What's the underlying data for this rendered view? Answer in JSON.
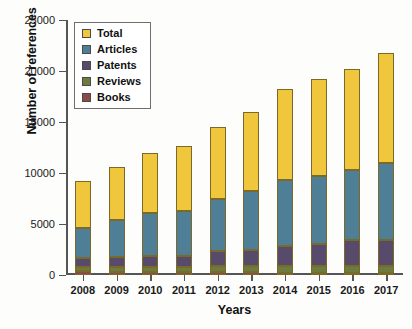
{
  "chart_data": {
    "type": "bar",
    "subtype": "stacked-bar",
    "title": "",
    "xlabel": "Years",
    "ylabel": "Number of references",
    "categories": [
      "2008",
      "2009",
      "2010",
      "2011",
      "2012",
      "2013",
      "2014",
      "2015",
      "2016",
      "2017"
    ],
    "ylim": [
      0,
      25000
    ],
    "ytick_values": [
      0,
      5000,
      10000,
      15000,
      20000,
      25000
    ],
    "ytick_labels": [
      "0",
      "5000",
      "10000",
      "15000",
      "20000",
      "25000"
    ],
    "grid": false,
    "legend_position": "top-left",
    "series": [
      {
        "name": "Books",
        "color": "#8C4A44",
        "values": [
          350,
          330,
          330,
          300,
          280,
          250,
          240,
          230,
          220,
          210
        ]
      },
      {
        "name": "Reviews",
        "color": "#6E7B3F",
        "values": [
          400,
          420,
          450,
          480,
          560,
          600,
          620,
          650,
          680,
          700
        ]
      },
      {
        "name": "Patents",
        "color": "#584A6B",
        "values": [
          950,
          1050,
          1120,
          1120,
          1560,
          1600,
          1940,
          2120,
          2550,
          2540
        ]
      },
      {
        "name": "Articles",
        "color": "#4E7F96",
        "values": [
          2900,
          3600,
          4200,
          4400,
          5100,
          5750,
          6550,
          6750,
          6850,
          7550
        ]
      },
      {
        "name": "Total",
        "color": "#F0C63C",
        "values": [
          4600,
          5200,
          5900,
          6400,
          7000,
          7800,
          8900,
          9450,
          9950,
          10800
        ]
      }
    ],
    "totals": [
      9200,
      10600,
      12000,
      12700,
      14500,
      16000,
      18250,
      19200,
      20250,
      21800
    ],
    "cumulative_tops": {
      "books": [
        350,
        330,
        330,
        300,
        280,
        250,
        240,
        230,
        220,
        210
      ],
      "reviews": [
        750,
        750,
        780,
        780,
        840,
        850,
        860,
        880,
        900,
        910
      ],
      "patents": [
        1700,
        1800,
        1900,
        1900,
        2400,
        2450,
        2800,
        3000,
        3450,
        3450
      ],
      "articles": [
        4600,
        5400,
        6100,
        6300,
        7500,
        8200,
        9350,
        9750,
        10300,
        11000
      ],
      "total": [
        9200,
        10600,
        12000,
        12700,
        14500,
        16000,
        18250,
        19200,
        20250,
        21800
      ]
    }
  },
  "legend": {
    "items": [
      {
        "label": "Total",
        "color": "#F0C63C"
      },
      {
        "label": "Articles",
        "color": "#4E7F96"
      },
      {
        "label": "Patents",
        "color": "#584A6B"
      },
      {
        "label": "Reviews",
        "color": "#6E7B3F"
      },
      {
        "label": "Books",
        "color": "#8C4A44"
      }
    ]
  }
}
